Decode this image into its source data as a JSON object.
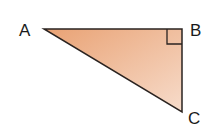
{
  "diagram": {
    "type": "right-triangle",
    "vertices": [
      {
        "label": "A",
        "x": 44,
        "y": 29
      },
      {
        "label": "B",
        "x": 182,
        "y": 29
      },
      {
        "label": "C",
        "x": 182,
        "y": 112
      }
    ],
    "right_angle_at": "B",
    "fill_gradient": [
      "#eaa679",
      "#f6d8c6"
    ],
    "stroke_color": "#2a2320"
  },
  "labels": {
    "a": "A",
    "b": "B",
    "c": "C"
  }
}
